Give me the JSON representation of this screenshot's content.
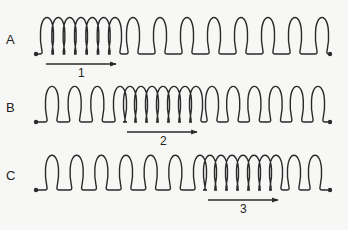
{
  "diagram": {
    "type": "compression-wave-in-spring",
    "stroke_color": "#2a2a2a",
    "background": "#f7f7f5",
    "rows": [
      {
        "label": "A",
        "baseline_y": 54,
        "loop_top_y": 14,
        "x_start": 36,
        "x_end": 330,
        "segments": [
          {
            "kind": "compressed",
            "loops": 7,
            "x_from": 47,
            "x_to": 115
          },
          {
            "kind": "spaced",
            "loops": 8,
            "x_from": 133,
            "x_to": 322
          }
        ],
        "arrow": {
          "label": "1",
          "x_from": 46,
          "x_to": 116,
          "y": 64,
          "label_x": 80,
          "label_y": 68
        }
      },
      {
        "label": "B",
        "baseline_y": 122,
        "loop_top_y": 83,
        "x_start": 36,
        "x_end": 330,
        "segments": [
          {
            "kind": "spaced",
            "loops": 4,
            "x_from": 52,
            "x_to": 120
          },
          {
            "kind": "compressed",
            "loops": 7,
            "x_from": 130,
            "x_to": 196
          },
          {
            "kind": "spaced",
            "loops": 6,
            "x_from": 212,
            "x_to": 318
          }
        ],
        "arrow": {
          "label": "2",
          "x_from": 127,
          "x_to": 197,
          "y": 132,
          "label_x": 162,
          "label_y": 135
        }
      },
      {
        "label": "C",
        "baseline_y": 190,
        "loop_top_y": 152,
        "x_start": 36,
        "x_end": 330,
        "segments": [
          {
            "kind": "spaced",
            "loops": 7,
            "x_from": 52,
            "x_to": 200
          },
          {
            "kind": "compressed",
            "loops": 7,
            "x_from": 210,
            "x_to": 276
          },
          {
            "kind": "spaced",
            "loops": 2,
            "x_from": 294,
            "x_to": 315
          }
        ],
        "arrow": {
          "label": "3",
          "x_from": 208,
          "x_to": 278,
          "y": 200,
          "label_x": 243,
          "label_y": 203
        }
      }
    ]
  }
}
